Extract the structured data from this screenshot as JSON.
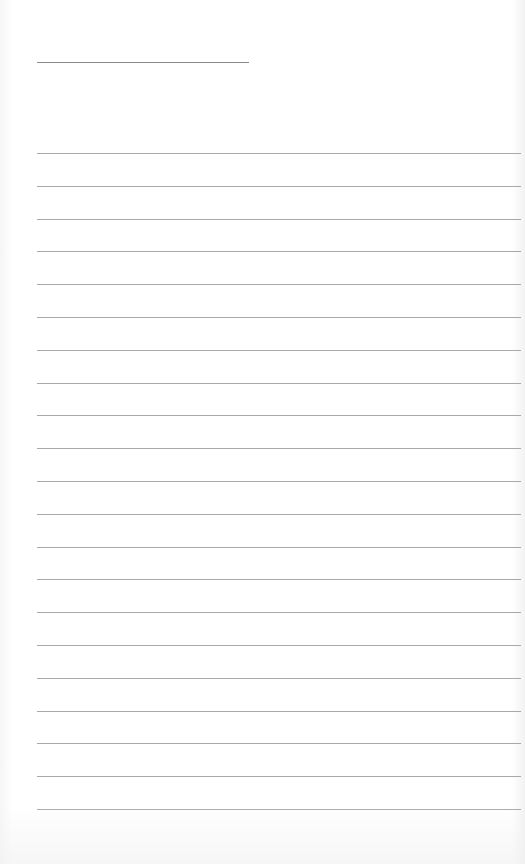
{
  "page": {
    "type": "lined-paper",
    "background_color": "#ffffff",
    "line_color": "#a9a9a9",
    "title_line": {
      "x": 37,
      "y": 62,
      "width": 212,
      "color": "#8a8a8a"
    },
    "ruled_lines": {
      "count": 21,
      "x": 37,
      "width": 484,
      "first_y": 153,
      "spacing": 32.8
    }
  }
}
